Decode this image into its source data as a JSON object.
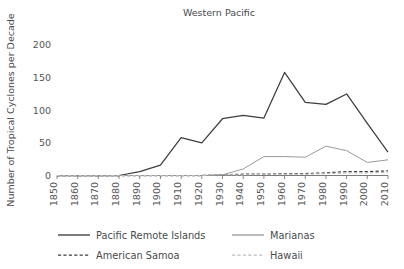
{
  "chart_data": {
    "type": "line",
    "title": "Western Pacific",
    "xlabel": "",
    "ylabel": "Number of Tropical Cyclones per Decade",
    "categories": [
      "1850",
      "1860",
      "1870",
      "1880",
      "1890",
      "1900",
      "1910",
      "1920",
      "1930",
      "1940",
      "1950",
      "1960",
      "1970",
      "1980",
      "1990",
      "2000",
      "2010"
    ],
    "x": [
      1850,
      1860,
      1870,
      1880,
      1890,
      1900,
      1910,
      1920,
      1930,
      1940,
      1950,
      1960,
      1970,
      1980,
      1990,
      2000,
      2010
    ],
    "ylim": [
      0,
      200
    ],
    "yticks": [
      0,
      50,
      100,
      150,
      200
    ],
    "ytick_labels": [
      "0",
      "50",
      "100",
      "150",
      "200"
    ],
    "grid": false,
    "legend_position": "bottom",
    "series": [
      {
        "name": "Pacific Remote Islands",
        "style": "solid",
        "color": "#3d3d3d",
        "values": [
          0,
          0,
          0,
          0,
          6,
          16,
          58,
          50,
          87,
          92,
          88,
          158,
          112,
          109,
          125,
          80,
          36
        ]
      },
      {
        "name": "Marianas",
        "style": "solid",
        "color": "#9a9a9a",
        "values": [
          0,
          0,
          0,
          0,
          0,
          0,
          0,
          0,
          1,
          10,
          29,
          29,
          28,
          45,
          38,
          20,
          24
        ]
      },
      {
        "name": "American Samoa",
        "style": "dashed",
        "color": "#3d3d3d",
        "values": [
          0,
          0,
          0,
          0,
          0,
          0,
          0,
          0,
          1,
          2,
          2,
          3,
          3,
          4,
          6,
          6,
          7
        ]
      },
      {
        "name": "Hawaii",
        "style": "dashed",
        "color": "#bdbdbd",
        "values": [
          0,
          0,
          0,
          0,
          0,
          0,
          0,
          0,
          1,
          1,
          2,
          2,
          2,
          3,
          4,
          4,
          5
        ]
      }
    ]
  },
  "colors": {
    "axis": "#6b6b6b",
    "text": "#4a4a4a",
    "background": "#ffffff",
    "pacific_remote_islands": "#3d3d3d",
    "marianas": "#9a9a9a",
    "american_samoa": "#3d3d3d",
    "hawaii": "#bdbdbd"
  },
  "legend": {
    "entries": [
      {
        "label": "Pacific Remote Islands"
      },
      {
        "label": "Marianas"
      },
      {
        "label": "American Samoa"
      },
      {
        "label": "Hawaii"
      }
    ]
  }
}
